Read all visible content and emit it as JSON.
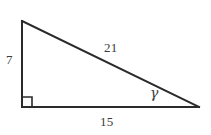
{
  "figure": {
    "kind": "right-triangle-diagram",
    "canvas": {
      "width": 211,
      "height": 135,
      "background": "#ffffff"
    },
    "stroke_color": "#2b2b2b",
    "text_color": "#3c3c3c",
    "vertices": {
      "apex": {
        "x": 22,
        "y": 21
      },
      "right_angle": {
        "x": 22,
        "y": 107
      },
      "acute": {
        "x": 199,
        "y": 107
      }
    },
    "right_angle_marker": {
      "name": "right-angle-square",
      "size": 10,
      "at_vertex": "right_angle"
    },
    "labels": {
      "leg_left": "7",
      "hypotenuse": "21",
      "leg_base": "15",
      "angle_gamma": "γ"
    }
  }
}
